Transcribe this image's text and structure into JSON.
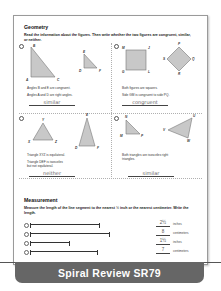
{
  "geometry": {
    "title": "Geometry",
    "instructions": "Read the information about the figures. Then write whether the two figures are congruent, similar, or neither.",
    "problems": [
      {
        "number": "1",
        "figure1_labels": [
          "B",
          "A",
          "C"
        ],
        "figure2_labels": [
          "E",
          "D",
          "F"
        ],
        "statements": [
          "Angles B and E are congruent.",
          "Angles A and D are right angles."
        ],
        "answer": "similar"
      },
      {
        "number": "2",
        "figure1_labels": [
          "M",
          "J",
          "G",
          "L"
        ],
        "figure2_labels": [
          "P",
          "S",
          "Q",
          "R"
        ],
        "statements": [
          "Both figures are squares.",
          "Side GM is congruent to side PQ."
        ],
        "answer": "congruent"
      },
      {
        "number": "3",
        "figure1_labels": [
          "Y",
          "X",
          "Z"
        ],
        "figure2_labels": [
          "E",
          "D",
          "F"
        ],
        "statements": [
          "Triangle XYZ is equilateral.",
          "Triangle DEF is isosceles but not equilateral."
        ],
        "answer": "neither"
      },
      {
        "number": "4",
        "figure1_labels": [
          "N",
          "M",
          "P"
        ],
        "figure2_labels": [
          "U",
          "V",
          "W"
        ],
        "statements": [
          "Both triangles are isosceles right triangles."
        ],
        "answer": "similar"
      }
    ]
  },
  "measurement": {
    "title": "Measurement",
    "instructions": "Measure the length of the line segment to the nearest ½ inch or the nearest centimeter. Write the length.",
    "items": [
      {
        "number": "5",
        "answer": "2½",
        "unit": "inches"
      },
      {
        "number": "6",
        "answer": "8",
        "unit": "centimeters"
      },
      {
        "number": "7",
        "answer": "1½",
        "unit": "inches"
      },
      {
        "number": "8",
        "answer": "7",
        "unit": "centimeters"
      }
    ]
  },
  "footer": {
    "title": "Spiral Review SR79"
  },
  "colors": {
    "shape_fill": "#c8c8c8",
    "footer_bg": "#666666",
    "footer_text": "#ffffff"
  }
}
